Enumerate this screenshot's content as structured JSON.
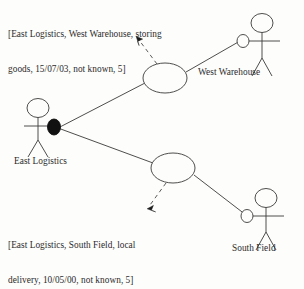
{
  "diagram": {
    "kind": "uml-use-case-diagram",
    "background_color": "#fdfdfb",
    "stroke_color": "#3a3a3a",
    "text_color": "#2b2b2b",
    "fill_marker_color": "#111111"
  },
  "notes": [
    {
      "id": "storing",
      "line1": "[East Logistics, West Warehouse, storing",
      "line2": "goods, 15/07/03, not known, 5]",
      "fields": {
        "source": "East Logistics",
        "target": "West Warehouse",
        "activity": "storing goods",
        "date": "15/07/03",
        "status": "not known",
        "quantity": "5"
      }
    },
    {
      "id": "delivery",
      "line1": "[East Logistics, South Field, local",
      "line2": "delivery, 10/05/00, not known, 5]",
      "fields": {
        "source": "East Logistics",
        "target": "South Field",
        "activity": "local delivery",
        "date": "10/05/00",
        "status": "not known",
        "quantity": "5"
      }
    }
  ],
  "actors": [
    {
      "id": "west-warehouse",
      "label": "West Warehouse",
      "connector": "hollow-ellipse"
    },
    {
      "id": "east-logistics",
      "label": "East Logistics",
      "connector": "filled-ellipse"
    },
    {
      "id": "south-field",
      "label": "South Field",
      "connector": "hollow-ellipse"
    }
  ],
  "use_cases": [
    {
      "id": "upper",
      "label": ""
    },
    {
      "id": "lower",
      "label": ""
    }
  ],
  "associations": [
    {
      "from": "east-logistics",
      "to": "west-warehouse",
      "via": "upper"
    },
    {
      "from": "east-logistics",
      "to": "south-field",
      "via": "lower"
    }
  ],
  "annotation_links": [
    {
      "from": "upper",
      "to": "storing",
      "style": "dashed-arrow"
    },
    {
      "from": "lower",
      "to": "delivery",
      "style": "dashed-arrow"
    }
  ]
}
